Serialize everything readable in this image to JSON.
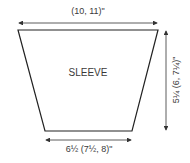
{
  "diagram": {
    "shape": "trapezoid",
    "label": "SLEEVE",
    "dimensions": {
      "top_width": "(10, 11)\"",
      "bottom_width": "6½ (7½, 8)\"",
      "height": "5¼ (6, 7¼)\""
    },
    "colors": {
      "line": "#333333",
      "background": "#ffffff"
    }
  }
}
